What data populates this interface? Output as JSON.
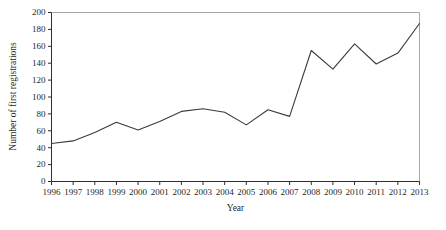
{
  "figure": {
    "background": "#ffffff"
  },
  "chart_data": {
    "type": "line",
    "title": "",
    "xlabel": "Year",
    "ylabel": "Number of first registrations",
    "categories": [
      "1996",
      "1997",
      "1998",
      "1999",
      "2000",
      "2001",
      "2002",
      "2003",
      "2004",
      "2005",
      "2006",
      "2007",
      "2008",
      "2009",
      "2010",
      "2011",
      "2012",
      "2013"
    ],
    "series": [
      {
        "name": "First registrations",
        "values": [
          45,
          48,
          58,
          70,
          61,
          71,
          83,
          86,
          82,
          67,
          85,
          77,
          155,
          133,
          163,
          139,
          152,
          187
        ]
      }
    ],
    "ylim": [
      0,
      200
    ],
    "ytick_step": 20,
    "yticks": [
      0,
      20,
      40,
      60,
      80,
      100,
      120,
      140,
      160,
      180,
      200
    ],
    "grid": false,
    "legend_position": "none",
    "colors": {
      "line": "#3a3a3a",
      "axis": "#2e2e2e",
      "frame": "#a8a8a8",
      "text": "#1f1f1f",
      "background": "#ffffff"
    }
  }
}
